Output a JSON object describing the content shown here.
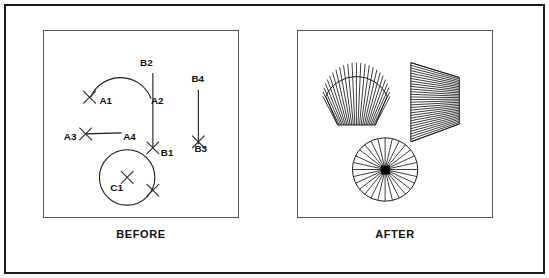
{
  "figure": {
    "frame_color": "#1a1a1a",
    "panel_border_color": "#555555",
    "background": "#ffffff",
    "line_color": "#1a1a1a",
    "hub_color": "#000000"
  },
  "panels": [
    {
      "id": "before",
      "caption": "BEFORE",
      "description": "Source geometry with pick-point X markers",
      "labels": [
        {
          "text": "A1",
          "x": 56,
          "y": 74,
          "anchor": "start"
        },
        {
          "text": "A2",
          "x": 108,
          "y": 74,
          "anchor": "start"
        },
        {
          "text": "A3",
          "x": 20,
          "y": 110,
          "anchor": "start"
        },
        {
          "text": "A4",
          "x": 80,
          "y": 110,
          "anchor": "start"
        },
        {
          "text": "B1",
          "x": 118,
          "y": 126,
          "anchor": "start"
        },
        {
          "text": "B2",
          "x": 97,
          "y": 35,
          "anchor": "start"
        },
        {
          "text": "B3",
          "x": 152,
          "y": 122,
          "anchor": "start"
        },
        {
          "text": "B4",
          "x": 149,
          "y": 52,
          "anchor": "start"
        },
        {
          "text": "C1",
          "x": 67,
          "y": 162,
          "anchor": "start"
        }
      ],
      "entities": [
        {
          "name": "arc-a1-a2",
          "type": "arc"
        },
        {
          "name": "line-a3-a4",
          "type": "line"
        },
        {
          "name": "line-b2-b1",
          "type": "line"
        },
        {
          "name": "line-b4-b3",
          "type": "line"
        },
        {
          "name": "circle-c1",
          "type": "circle"
        }
      ],
      "markers": [
        {
          "name": "marker-a1",
          "x": 46,
          "y": 66
        },
        {
          "name": "marker-a3",
          "x": 42,
          "y": 104
        },
        {
          "name": "marker-b1",
          "x": 110,
          "y": 118
        },
        {
          "name": "marker-b3",
          "x": 155,
          "y": 112
        },
        {
          "name": "marker-c1-center",
          "x": 84,
          "y": 148
        },
        {
          "name": "marker-c1-edge",
          "x": 110,
          "y": 161
        }
      ]
    },
    {
      "id": "after",
      "caption": "AFTER",
      "description": "Resulting ruled surfaces",
      "surfaces": [
        {
          "name": "shell-surface",
          "type": "fan",
          "rulings": 24
        },
        {
          "name": "trapezoid-surface",
          "type": "quad-mesh",
          "rulings": 30
        },
        {
          "name": "wheel-surface",
          "type": "radial-hub",
          "rulings": 28
        }
      ]
    }
  ]
}
